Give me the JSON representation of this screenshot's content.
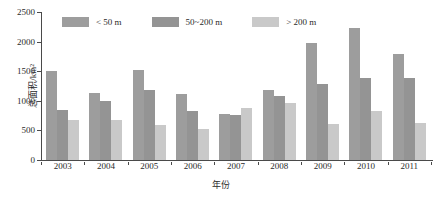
{
  "chart_data": {
    "type": "bar",
    "title": "",
    "xlabel": "年份",
    "ylabel": "总面积/km²",
    "categories": [
      "2003",
      "2004",
      "2005",
      "2006",
      "2007",
      "2008",
      "2009",
      "2010",
      "2011"
    ],
    "ylim": [
      0,
      2500
    ],
    "yticks": [
      0,
      500,
      1000,
      1500,
      2000,
      2500
    ],
    "ytick_labels": [
      "0",
      "500",
      "1000",
      "1500",
      "2000",
      "2500"
    ],
    "grid": false,
    "legend_position": "top-left-inside",
    "series": [
      {
        "name": "< 50 m",
        "color": "#9d9d9d",
        "values": [
          1500,
          1135,
          1525,
          1120,
          780,
          1190,
          1975,
          2235,
          1785
        ]
      },
      {
        "name": "50~200 m",
        "color": "#949494",
        "values": [
          840,
          1000,
          1190,
          820,
          755,
          1080,
          1290,
          1390,
          1390
        ]
      },
      {
        "name": "> 200 m",
        "color": "#c9c9c9",
        "values": [
          670,
          670,
          595,
          525,
          880,
          965,
          605,
          820,
          630
        ]
      }
    ]
  },
  "axis": {
    "y_title": "总面积/km²",
    "x_title": "年份"
  }
}
